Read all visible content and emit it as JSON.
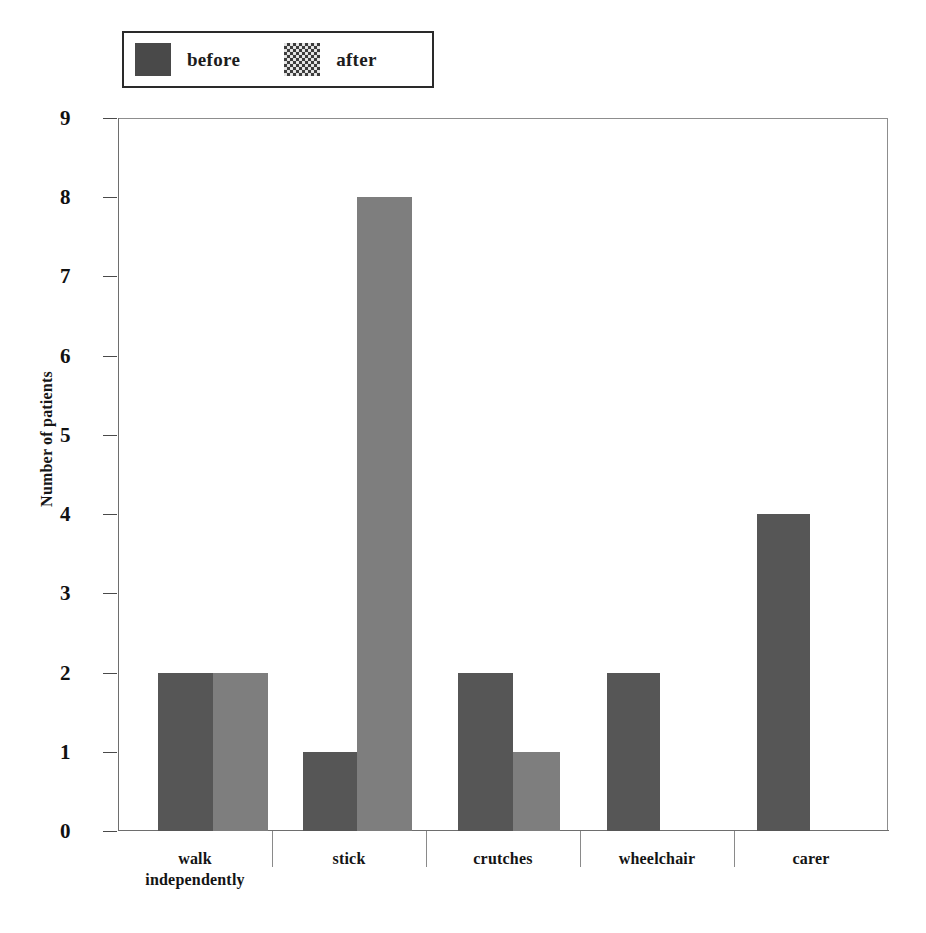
{
  "chart_data": {
    "type": "bar",
    "title": "",
    "subtitle": "",
    "xlabel": "",
    "ylabel": "Number of patients",
    "ylim": [
      0,
      9
    ],
    "ytick_labels": [
      "0",
      "1",
      "2",
      "3",
      "4",
      "5",
      "6",
      "7",
      "8",
      "9"
    ],
    "ytick_values": [
      0,
      1,
      2,
      3,
      4,
      5,
      6,
      7,
      8,
      9
    ],
    "grid": false,
    "legend_position": "top-left-outside",
    "categories": [
      "walk independently",
      "stick",
      "crutches",
      "wheelchair",
      "carer"
    ],
    "category_lines": [
      [
        "walk",
        "independently"
      ],
      [
        "stick"
      ],
      [
        "crutches"
      ],
      [
        "wheelchair"
      ],
      [
        "carer"
      ]
    ],
    "series": [
      {
        "name": "before",
        "values": [
          2,
          1,
          2,
          2,
          4
        ],
        "color": "#565656"
      },
      {
        "name": "after",
        "values": [
          2,
          8,
          1,
          0,
          0
        ],
        "color": "#7e7e7e"
      }
    ]
  },
  "legend": {
    "entries": [
      {
        "label": "before",
        "swatch": "solid-dark-swatch"
      },
      {
        "label": "after",
        "swatch": "dotted-pattern-swatch"
      }
    ]
  },
  "axes": {
    "y_title": "Number of patients",
    "y_ticks": [
      "9",
      "8",
      "7",
      "6",
      "5",
      "4",
      "3",
      "2",
      "1",
      "0"
    ],
    "x_categories": [
      {
        "line1": "walk",
        "line2": "independently"
      },
      {
        "line1": "stick",
        "line2": ""
      },
      {
        "line1": "crutches",
        "line2": ""
      },
      {
        "line1": "wheelchair",
        "line2": ""
      },
      {
        "line1": "carer",
        "line2": ""
      }
    ]
  },
  "colors": {
    "before": "#565656",
    "after": "#7e7e7e",
    "frame": "#8d8d8d",
    "text": "#141414",
    "background": "#ffffff"
  }
}
